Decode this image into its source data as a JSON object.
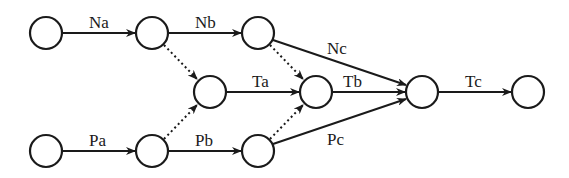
{
  "diagram": {
    "type": "network-graph",
    "nodes": [
      {
        "id": "n0",
        "x": 46,
        "y": 33
      },
      {
        "id": "n1",
        "x": 152,
        "y": 33
      },
      {
        "id": "n2",
        "x": 258,
        "y": 33
      },
      {
        "id": "t1",
        "x": 210,
        "y": 92
      },
      {
        "id": "t2",
        "x": 316,
        "y": 92
      },
      {
        "id": "t3",
        "x": 422,
        "y": 92
      },
      {
        "id": "t4",
        "x": 528,
        "y": 92
      },
      {
        "id": "p0",
        "x": 46,
        "y": 151
      },
      {
        "id": "p1",
        "x": 152,
        "y": 151
      },
      {
        "id": "p2",
        "x": 258,
        "y": 151
      }
    ],
    "edges": [
      {
        "from": "n0",
        "to": "n1",
        "label": "Na",
        "style": "solid"
      },
      {
        "from": "n1",
        "to": "n2",
        "label": "Nb",
        "style": "solid"
      },
      {
        "from": "n2",
        "to": "t3",
        "label": "Nc",
        "style": "solid"
      },
      {
        "from": "t1",
        "to": "t2",
        "label": "Ta",
        "style": "solid"
      },
      {
        "from": "t2",
        "to": "t3",
        "label": "Tb",
        "style": "solid"
      },
      {
        "from": "t3",
        "to": "t4",
        "label": "Tc",
        "style": "solid"
      },
      {
        "from": "p0",
        "to": "p1",
        "label": "Pa",
        "style": "solid"
      },
      {
        "from": "p1",
        "to": "p2",
        "label": "Pb",
        "style": "solid"
      },
      {
        "from": "p2",
        "to": "t3",
        "label": "Pc",
        "style": "solid"
      },
      {
        "from": "n1",
        "to": "t1",
        "label": "",
        "style": "dotted"
      },
      {
        "from": "p1",
        "to": "t1",
        "label": "",
        "style": "dotted"
      },
      {
        "from": "n2",
        "to": "t2",
        "label": "",
        "style": "dotted"
      },
      {
        "from": "p2",
        "to": "t2",
        "label": "",
        "style": "dotted"
      }
    ],
    "labels": {
      "na": "Na",
      "nb": "Nb",
      "nc": "Nc",
      "ta": "Ta",
      "tb": "Tb",
      "tc": "Tc",
      "pa": "Pa",
      "pb": "Pb",
      "pc": "Pc"
    },
    "colors": {
      "stroke": "#1a1a1a",
      "background": "#ffffff"
    }
  }
}
